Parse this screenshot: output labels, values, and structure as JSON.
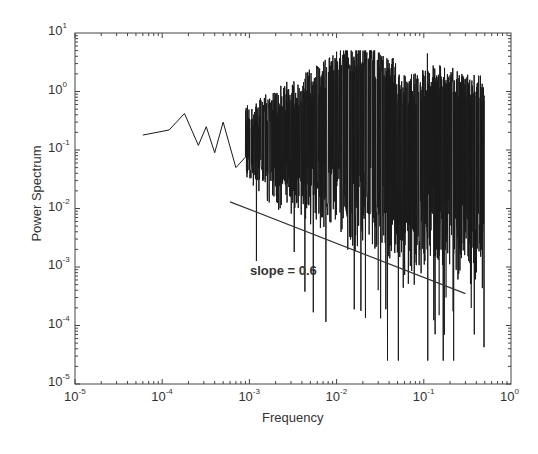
{
  "chart_data": {
    "type": "line",
    "title": "",
    "xlabel": "Frequency",
    "ylabel": "Power Spectrum",
    "xscale": "log",
    "yscale": "log",
    "xlim": [
      1e-05,
      1
    ],
    "ylim": [
      1e-05,
      10
    ],
    "grid": false,
    "legend": null,
    "x_ticks": [
      {
        "base": "10",
        "exp": "-5"
      },
      {
        "base": "10",
        "exp": "-4"
      },
      {
        "base": "10",
        "exp": "-3"
      },
      {
        "base": "10",
        "exp": "-2"
      },
      {
        "base": "10",
        "exp": "-1"
      },
      {
        "base": "10",
        "exp": "0"
      }
    ],
    "y_ticks": [
      {
        "base": "10",
        "exp": "1"
      },
      {
        "base": "10",
        "exp": "0"
      },
      {
        "base": "10",
        "exp": "-1"
      },
      {
        "base": "10",
        "exp": "-2"
      },
      {
        "base": "10",
        "exp": "-3"
      },
      {
        "base": "10",
        "exp": "-4"
      },
      {
        "base": "10",
        "exp": "-5"
      }
    ],
    "series": [
      {
        "name": "power spectrum",
        "color": "#1a1a1a",
        "x_range": [
          6e-05,
          0.5
        ],
        "landmarks": [
          {
            "x": 6e-05,
            "y": 0.18
          },
          {
            "x": 0.00012,
            "y": 0.22
          },
          {
            "x": 0.00018,
            "y": 0.42
          },
          {
            "x": 0.00026,
            "y": 0.12
          },
          {
            "x": 0.00032,
            "y": 0.25
          },
          {
            "x": 0.0004,
            "y": 0.09
          },
          {
            "x": 0.0005,
            "y": 0.3
          },
          {
            "x": 0.0007,
            "y": 0.05
          },
          {
            "x": 0.0009,
            "y": 0.012
          },
          {
            "x": 0.0015,
            "y": 0.3
          },
          {
            "x": 0.003,
            "y": 0.6
          },
          {
            "x": 0.01,
            "y": 2.0
          },
          {
            "x": 0.015,
            "y": 3.5
          },
          {
            "x": 0.03,
            "y": 1.0
          },
          {
            "x": 0.11,
            "y": 4.5
          },
          {
            "x": 0.15,
            "y": 0.002
          },
          {
            "x": 0.22,
            "y": 2.5e-05
          },
          {
            "x": 0.3,
            "y": 1.2
          },
          {
            "x": 0.5,
            "y": 0.3
          }
        ],
        "envelope": {
          "upper_mean_high_freq": 1.0,
          "lower_typical_high_freq": 0.005,
          "min_dip": 2.5e-05
        }
      },
      {
        "name": "slope fit line",
        "color": "#333333",
        "x": [
          0.0006,
          0.3
        ],
        "y": [
          0.013,
          0.00035
        ]
      }
    ],
    "annotations": [
      {
        "text": "slope = 0.6",
        "x": 0.0012,
        "y": 0.001
      }
    ]
  }
}
